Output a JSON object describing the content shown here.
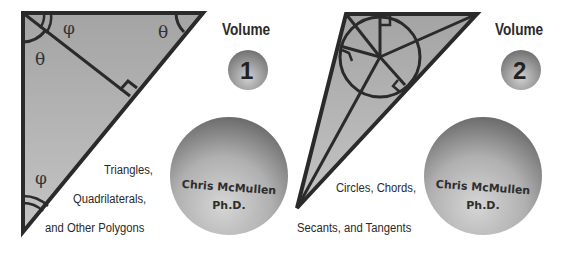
{
  "volume1": {
    "volume_label": "Volume",
    "number": "1",
    "subtitle_lines": [
      "Triangles,",
      "Quadrilaterals,",
      "and Other Polygons"
    ],
    "author_name": "Chris McMullen",
    "author_degree": "Ph.D.",
    "angle_symbols": {
      "top_left": "θ",
      "top_mid": "φ",
      "top_right": "θ",
      "bottom": "φ"
    }
  },
  "volume2": {
    "volume_label": "Volume",
    "number": "2",
    "subtitle_lines": [
      "Circles, Chords,",
      "Secants, and Tangents"
    ],
    "author_name": "Chris McMullen",
    "author_degree": "Ph.D."
  },
  "colors": {
    "triangle_fill": "#a8a8a8",
    "stroke": "#2a2a2a",
    "sphere_light": "#c8c8c8",
    "sphere_dark": "#6e6e6e",
    "text": "#2a2a2a"
  }
}
